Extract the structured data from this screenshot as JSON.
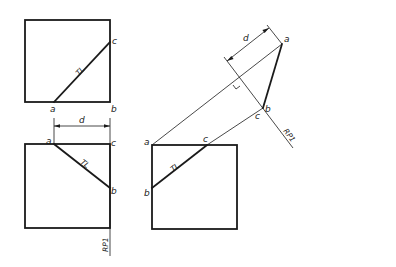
{
  "diagram": {
    "type": "orthographic auxiliary view construction",
    "labels": {
      "a": "a",
      "b": "b",
      "c": "c",
      "d": "d",
      "true_length": "TL",
      "reference_plane": "RP1"
    },
    "views": [
      {
        "name": "top-left-view",
        "points": [
          "a",
          "b",
          "c"
        ],
        "true_length_line": "a-c",
        "dimension": "d"
      },
      {
        "name": "bottom-left-view",
        "points": [
          "a",
          "b",
          "c"
        ],
        "true_length_line": "a-b",
        "reference_plane": "RP1"
      },
      {
        "name": "bottom-right-view",
        "points": [
          "a",
          "b",
          "c"
        ],
        "true_length_line": "b-c"
      },
      {
        "name": "auxiliary-view",
        "points": [
          "a",
          "b",
          "c"
        ],
        "dimension": "d",
        "reference_plane": "RP1"
      }
    ],
    "colors": {
      "line": "#1a1a1a",
      "background": "#ffffff"
    }
  }
}
